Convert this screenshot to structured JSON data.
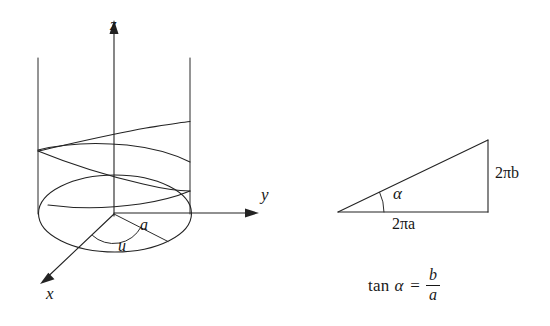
{
  "figure": {
    "background_color": "#ffffff",
    "line_color": "#232323"
  },
  "left_diagram": {
    "name": "cylinder-helix-3d",
    "axis_labels": {
      "x": "x",
      "y": "y",
      "z": "z"
    },
    "annotations": {
      "radius_label": "a",
      "angle_label": "u"
    },
    "geometry": {
      "origin": [
        115,
        213
      ],
      "ellipse_rx": 76,
      "ellipse_ry": 38,
      "cylinder_left_x": 38,
      "cylinder_right_x": 190,
      "cylinder_top_y": 58,
      "z_axis_tip": [
        114,
        22
      ],
      "y_axis_tip": [
        258,
        213
      ],
      "x_axis_tip": [
        40,
        283
      ]
    }
  },
  "right_diagram": {
    "name": "slope-triangle",
    "angle_label": "α",
    "base_label": "2πa",
    "height_label": "2πb",
    "geometry": {
      "left_vertex": [
        338,
        212
      ],
      "right_vertex": [
        488,
        212
      ],
      "top_vertex": [
        488,
        140
      ],
      "arc_radius": 46
    },
    "formula": {
      "function_name": "tan",
      "angle": "α",
      "equals": "=",
      "numerator": "b",
      "denominator": "a"
    }
  }
}
